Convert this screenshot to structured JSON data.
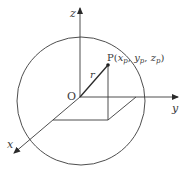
{
  "diagram": {
    "labels": {
      "z_axis": "z",
      "y_axis": "y",
      "x_axis": "x",
      "origin": "O",
      "radius": "r",
      "point_prefix": "P(",
      "xp": "x",
      "yp": "y",
      "zp": "z",
      "sub_p": "p",
      "comma": ", ",
      "close": ")"
    },
    "colors": {
      "line": "#3a3a3a",
      "background": "#ffffff"
    }
  }
}
